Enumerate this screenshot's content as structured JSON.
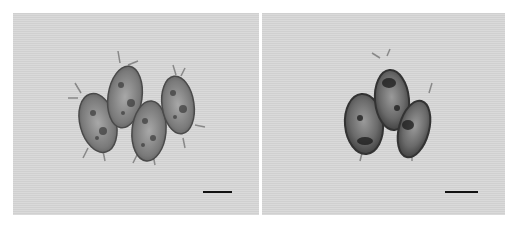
{
  "figure": {
    "panels": [
      {
        "id": "left",
        "description": "Four spiny elliptical spores/cells, brightfield micrograph",
        "cell_count": 4,
        "scale_bar": {
          "label": ""
        }
      },
      {
        "id": "right",
        "description": "Three elliptical spores/cells with darker granular contents, brightfield micrograph",
        "cell_count": 3,
        "scale_bar": {
          "label": ""
        }
      }
    ],
    "colors": {
      "background": "#d8d8d8",
      "cell_wall": "#5a5a5a",
      "cell_interior": "#8a8a8a",
      "scale_bar": "#111111"
    }
  }
}
